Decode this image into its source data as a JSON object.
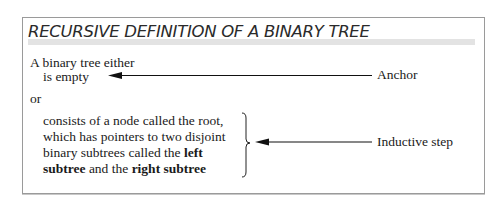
{
  "title": "RECURSIVE DEFINITION OF A BINARY TREE",
  "definition": {
    "intro": "A binary tree either",
    "anchor_case": "is empty",
    "connector": "or",
    "inductive_lines": [
      {
        "plain": "consists of a node called the root,"
      },
      {
        "plain": "which has pointers to two disjoint"
      },
      {
        "plain_before": "binary subtrees called the ",
        "bold": "left"
      },
      {
        "bold": "subtree",
        "plain_middle": " and the ",
        "bold2": "right subtree"
      }
    ]
  },
  "annotations": {
    "anchor_label": "Anchor",
    "inductive_label": "Inductive step"
  },
  "colors": {
    "border": "#9a9a9a",
    "title_band": "#e3e3e3",
    "text": "#1a1a1a"
  }
}
